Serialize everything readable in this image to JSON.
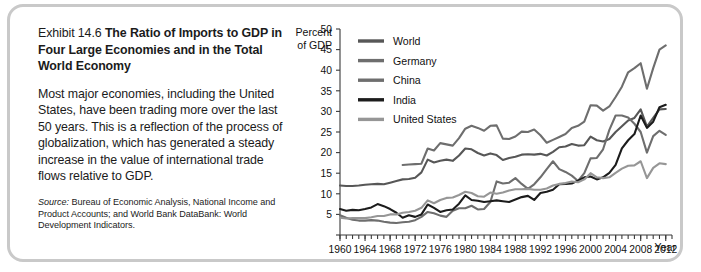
{
  "exhibit": {
    "label": "Exhibit 14.6",
    "title": " The Ratio of Imports to GDP in Four Large Economies and in the Total World Economy",
    "body": "Most major economies, including the United States, have been trading more over the last 50 years. This is a reflection of the process of globalization, which has generated a steady increase in the value of international trade flows relative to GDP.",
    "source_label": "Source:",
    "source_text": " Bureau of Economic Analysis, National Income and Product Accounts; and World Bank DataBank: World Development Indicators."
  },
  "chart_data": {
    "type": "line",
    "title": "The Ratio of Imports to GDP in Four Large Economies and in the Total World Economy",
    "xlabel": "Year",
    "ylabel": "Percent of GDP",
    "ylabel_line1": "Percent",
    "ylabel_line2": "of GDP",
    "grid": false,
    "legend_position": "top-left",
    "xlim": [
      1960,
      2013
    ],
    "ylim": [
      0,
      50
    ],
    "yticks": [
      0,
      5,
      10,
      15,
      20,
      25,
      30,
      35,
      40,
      45,
      50
    ],
    "ytick_labels": [
      "",
      "5",
      "10",
      "15",
      "20",
      "25",
      "30",
      "35",
      "40",
      "45",
      "50"
    ],
    "xticks": [
      1960,
      1964,
      1968,
      1972,
      1976,
      1980,
      1984,
      1988,
      1992,
      1996,
      2000,
      2004,
      2008,
      2012
    ],
    "xtick_labels": [
      "1960",
      "1964",
      "1968",
      "1972",
      "1976",
      "1980",
      "1984",
      "1988",
      "1992",
      "1996",
      "2000",
      "2004",
      "2008",
      "2012"
    ],
    "x": [
      1960,
      1961,
      1962,
      1963,
      1964,
      1965,
      1966,
      1967,
      1968,
      1969,
      1970,
      1971,
      1972,
      1973,
      1974,
      1975,
      1976,
      1977,
      1978,
      1979,
      1980,
      1981,
      1982,
      1983,
      1984,
      1985,
      1986,
      1987,
      1988,
      1989,
      1990,
      1991,
      1992,
      1993,
      1994,
      1995,
      1996,
      1997,
      1998,
      1999,
      2000,
      2001,
      2002,
      2003,
      2004,
      2005,
      2006,
      2007,
      2008,
      2009,
      2010,
      2011,
      2012
    ],
    "series": [
      {
        "name": "World",
        "color": "#575757",
        "values": [
          12.0,
          11.9,
          11.9,
          12.0,
          12.2,
          12.3,
          12.4,
          12.3,
          12.7,
          13.1,
          13.5,
          13.6,
          13.9,
          15.2,
          18.3,
          17.6,
          18.0,
          18.3,
          18.0,
          19.3,
          21.0,
          20.8,
          19.9,
          19.3,
          19.8,
          19.4,
          18.2,
          18.7,
          19.0,
          19.5,
          19.6,
          19.5,
          19.7,
          19.3,
          20.2,
          21.3,
          21.5,
          22.1,
          21.7,
          21.8,
          23.9,
          23.0,
          22.7,
          23.3,
          25.0,
          26.4,
          27.8,
          28.4,
          30.5,
          26.3,
          28.4,
          30.5,
          30.6
        ]
      },
      {
        "name": "Germany",
        "color": "#6e6e6e",
        "values": [
          null,
          null,
          null,
          null,
          null,
          null,
          null,
          null,
          null,
          null,
          17.0,
          17.1,
          17.2,
          17.3,
          21.0,
          20.5,
          22.3,
          22.0,
          21.7,
          23.5,
          25.8,
          26.5,
          26.0,
          25.3,
          26.5,
          26.6,
          23.4,
          23.3,
          23.9,
          25.1,
          25.0,
          25.6,
          24.2,
          22.4,
          23.1,
          23.8,
          24.5,
          26.0,
          26.5,
          27.5,
          31.5,
          31.4,
          30.2,
          31.2,
          33.5,
          36.0,
          39.5,
          40.5,
          41.7,
          35.5,
          40.5,
          45.0,
          46.0
        ]
      },
      {
        "name": "China",
        "color": "#6e6e6e",
        "values": [
          4.8,
          4.2,
          3.7,
          3.5,
          3.5,
          3.6,
          3.5,
          3.2,
          3.0,
          2.9,
          3.1,
          3.2,
          3.6,
          4.4,
          5.6,
          5.3,
          4.7,
          4.4,
          5.9,
          6.5,
          6.5,
          7.1,
          6.2,
          6.3,
          8.0,
          13.0,
          12.5,
          12.7,
          13.8,
          12.4,
          11.2,
          12.3,
          14.0,
          16.0,
          17.9,
          16.0,
          15.3,
          14.4,
          13.1,
          15.0,
          18.6,
          18.7,
          20.8,
          25.5,
          29.0,
          29.0,
          28.5,
          27.0,
          25.0,
          20.0,
          24.0,
          25.3,
          24.3
        ]
      },
      {
        "name": "India",
        "color": "#1c1c1c",
        "values": [
          6.3,
          5.9,
          6.1,
          6.0,
          6.3,
          6.7,
          7.5,
          7.0,
          6.3,
          5.4,
          4.2,
          4.8,
          4.4,
          5.0,
          7.4,
          6.6,
          5.6,
          6.0,
          6.2,
          7.6,
          9.6,
          8.5,
          8.3,
          8.0,
          8.2,
          8.4,
          8.2,
          8.0,
          8.6,
          9.2,
          9.5,
          8.5,
          10.2,
          10.5,
          11.0,
          12.3,
          12.4,
          12.5,
          13.2,
          14.0,
          14.2,
          13.5,
          14.0,
          15.1,
          17.0,
          21.0,
          23.0,
          24.5,
          29.0,
          26.0,
          27.5,
          31.0,
          31.6
        ]
      },
      {
        "name": "United States",
        "color": "#969696",
        "values": [
          4.2,
          4.0,
          4.1,
          4.1,
          4.1,
          4.3,
          4.6,
          4.6,
          5.0,
          5.0,
          5.4,
          5.6,
          5.9,
          6.6,
          8.4,
          7.7,
          8.5,
          9.0,
          9.1,
          9.7,
          10.5,
          10.2,
          9.4,
          9.3,
          10.3,
          10.0,
          10.3,
          10.8,
          11.1,
          11.1,
          11.2,
          11.0,
          11.0,
          11.3,
          12.0,
          12.4,
          12.6,
          13.0,
          12.8,
          13.5,
          15.0,
          14.0,
          13.8,
          14.0,
          15.1,
          16.1,
          16.8,
          16.9,
          17.9,
          13.8,
          16.3,
          17.4,
          17.2
        ]
      }
    ]
  }
}
